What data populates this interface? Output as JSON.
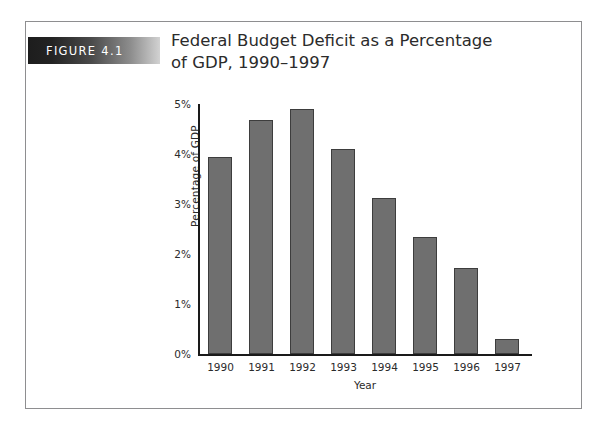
{
  "figure": {
    "tag": "FIGURE 4.1",
    "title_line1": "Federal Budget Deficit as a Percentage",
    "title_line2": "of GDP, 1990–1997"
  },
  "chart_data": {
    "type": "bar",
    "title": "Federal Budget Deficit as a Percentage of GDP, 1990–1997",
    "xlabel": "Year",
    "ylabel": "Percentage of GDP",
    "categories": [
      "1990",
      "1991",
      "1992",
      "1993",
      "1994",
      "1995",
      "1996",
      "1997"
    ],
    "values": [
      3.95,
      4.68,
      4.9,
      4.1,
      3.12,
      2.35,
      1.72,
      0.3
    ],
    "ylim": [
      0,
      5
    ],
    "ytick_values": [
      0,
      1,
      2,
      3,
      4,
      5
    ],
    "ytick_labels": [
      "0%",
      "1%",
      "2%",
      "3%",
      "4%",
      "5%"
    ],
    "grid": false,
    "legend": false,
    "bar_color": "#6f6f6f",
    "bar_edge_color": "#3d3d3d",
    "axis_color": "#1a1a1a"
  }
}
